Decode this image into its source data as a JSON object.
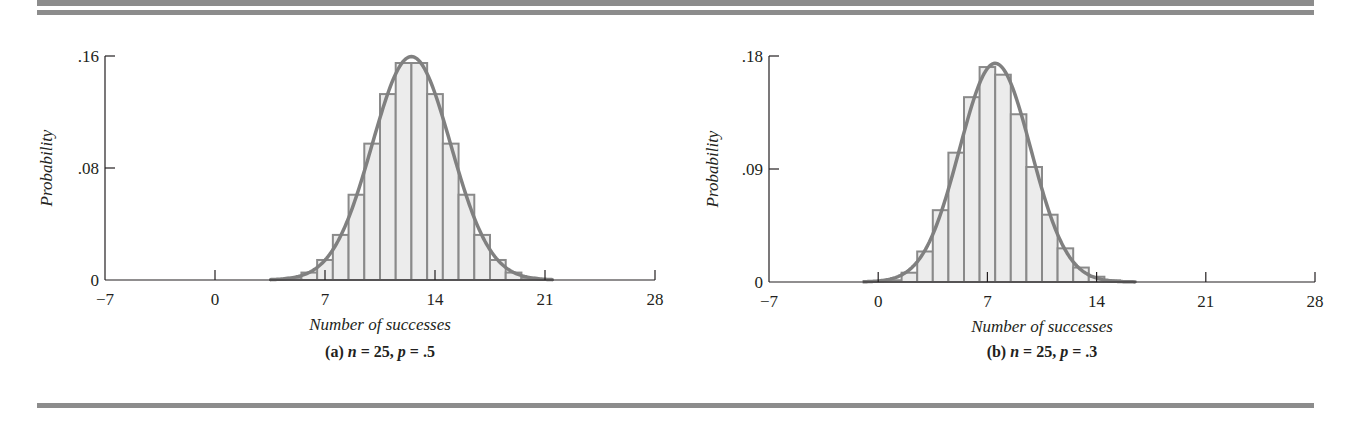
{
  "figure": {
    "rule_color": "#8c8c8c",
    "bar_fill": "#ececec",
    "bar_stroke": "#8a8a8a",
    "curve_color": "#808080",
    "axis_color": "#231f20"
  },
  "chart_data": [
    {
      "type": "bar",
      "subtype": "histogram_with_normal_curve",
      "title": "",
      "caption": "(a)  n = 25, p = .5",
      "caption_parts": {
        "label": "(a)",
        "n_var": "n",
        "n_eq": " = 25, ",
        "p_var": "p",
        "p_eq": " = .5"
      },
      "xlabel": "Number of successes",
      "ylabel": "Probability",
      "xlim": [
        -7,
        28
      ],
      "ylim": [
        0,
        0.16
      ],
      "x_ticks": [
        -7,
        0,
        7,
        14,
        21,
        28
      ],
      "x_tick_labels": [
        "−7",
        "0",
        "7",
        "14",
        "21",
        "28"
      ],
      "y_ticks": [
        0,
        0.08,
        0.16
      ],
      "y_tick_labels": [
        "0",
        ".08",
        ".16"
      ],
      "grid": false,
      "legend": null,
      "categories": [
        4,
        5,
        6,
        7,
        8,
        9,
        10,
        11,
        12,
        13,
        14,
        15,
        16,
        17,
        18,
        19,
        20,
        21
      ],
      "values": [
        0.0004,
        0.0016,
        0.0053,
        0.0143,
        0.0322,
        0.0609,
        0.0974,
        0.1328,
        0.155,
        0.155,
        0.1328,
        0.0974,
        0.0609,
        0.0322,
        0.0143,
        0.0053,
        0.0016,
        0.0004
      ],
      "normal_curve": {
        "mean": 12.5,
        "sd": 2.5,
        "x_range": [
          3.5,
          21.5
        ]
      },
      "layout": {
        "x0": 105,
        "x1": 655,
        "y_base": 280,
        "y_top": 56,
        "ylabel_x": 52,
        "caption_y": 357,
        "xlabel_y": 330,
        "ticklabel_y": 305
      }
    },
    {
      "type": "bar",
      "subtype": "histogram_with_normal_curve",
      "title": "",
      "caption": "(b)  n = 25, p = .3",
      "caption_parts": {
        "label": "(b)",
        "n_var": "n",
        "n_eq": " = 25, ",
        "p_var": "p",
        "p_eq": " = .3"
      },
      "xlabel": "Number of successes",
      "ylabel": "Probability",
      "xlim": [
        -7,
        28
      ],
      "ylim": [
        0,
        0.18
      ],
      "x_ticks": [
        -7,
        0,
        7,
        14,
        21,
        28
      ],
      "x_tick_labels": [
        "−7",
        "0",
        "7",
        "14",
        "21",
        "28"
      ],
      "y_ticks": [
        0,
        0.09,
        0.18
      ],
      "y_tick_labels": [
        "0",
        ".09",
        ".18"
      ],
      "grid": false,
      "legend": null,
      "categories": [
        0,
        1,
        2,
        3,
        4,
        5,
        6,
        7,
        8,
        9,
        10,
        11,
        12,
        13,
        14,
        15,
        16
      ],
      "values": [
        0.0001,
        0.0014,
        0.0074,
        0.0243,
        0.0572,
        0.103,
        0.1472,
        0.1712,
        0.1651,
        0.1336,
        0.0916,
        0.0536,
        0.0268,
        0.0115,
        0.0042,
        0.0013,
        0.0004
      ],
      "normal_curve": {
        "mean": 7.5,
        "sd": 2.291,
        "x_range": [
          -1,
          16.5
        ]
      },
      "layout": {
        "x0": 769,
        "x1": 1315,
        "y_base": 282,
        "y_top": 56,
        "ylabel_x": 718,
        "caption_y": 357,
        "xlabel_y": 332,
        "ticklabel_y": 307
      }
    }
  ]
}
